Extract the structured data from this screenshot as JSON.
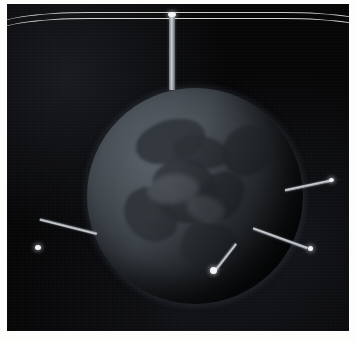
{
  "scene": {
    "title": "Earth globe with antenna booms in space",
    "background_color": "#050505",
    "frame_border_color": "#fdfdfb"
  },
  "globe": {
    "name": "Earth",
    "center_x": 195,
    "center_y": 196,
    "radius": 108,
    "base_color": "#4a5157",
    "land_color": "#2c3136",
    "glow_color": "#788ca0"
  },
  "orbit_lines": [
    {
      "label": "orbit-arc-upper",
      "color": "#d9d9d4"
    },
    {
      "label": "orbit-arc-lower",
      "color": "#e8e8e2"
    }
  ],
  "booms": [
    {
      "id": "top-pole",
      "label": "",
      "color": "#c6cbd0"
    },
    {
      "id": "right-boom",
      "label": "···",
      "color": "#cfd4d8"
    },
    {
      "id": "left-boom",
      "label": "",
      "color": "#cfd4d8"
    },
    {
      "id": "lower-right-boom",
      "label": "",
      "color": "#cfd4d8"
    },
    {
      "id": "bottom-boom",
      "label": "···",
      "color": "#cfd4d8"
    }
  ]
}
